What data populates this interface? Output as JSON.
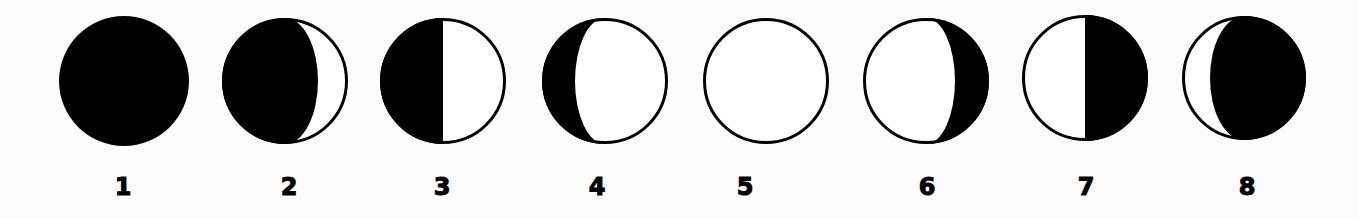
{
  "diagram": {
    "colors": {
      "background": "#fcfcfc",
      "dark": "#000000",
      "lit": "#ffffff",
      "outline": "#000000"
    },
    "phases": [
      {
        "label": "1",
        "cx": 124,
        "cy": 81,
        "r": 65,
        "type": "new",
        "lit_side": "none",
        "terminator_rx": 0
      },
      {
        "label": "2",
        "cx": 285,
        "cy": 81,
        "r": 63,
        "type": "waxing-crescent",
        "lit_side": "right",
        "terminator_rx": 33
      },
      {
        "label": "3",
        "cx": 443,
        "cy": 81,
        "r": 63,
        "type": "first-quarter",
        "lit_side": "right",
        "terminator_rx": 0
      },
      {
        "label": "4",
        "cx": 605,
        "cy": 81,
        "r": 63,
        "type": "waxing-gibbous",
        "lit_side": "right",
        "terminator_rx": 30
      },
      {
        "label": "5",
        "cx": 766,
        "cy": 81,
        "r": 63,
        "type": "full",
        "lit_side": "all",
        "terminator_rx": 0
      },
      {
        "label": "6",
        "cx": 926,
        "cy": 81,
        "r": 63,
        "type": "waning-gibbous",
        "lit_side": "left",
        "terminator_rx": 29
      },
      {
        "label": "7",
        "cx": 1085,
        "cy": 78,
        "r": 63,
        "type": "last-quarter",
        "lit_side": "left",
        "terminator_rx": 0
      },
      {
        "label": "8",
        "cx": 1244,
        "cy": 78,
        "r": 62,
        "type": "waning-crescent",
        "lit_side": "left",
        "terminator_rx": 34
      }
    ],
    "label_positions_x": [
      123,
      289,
      442,
      597,
      745,
      927,
      1086,
      1247
    ]
  }
}
